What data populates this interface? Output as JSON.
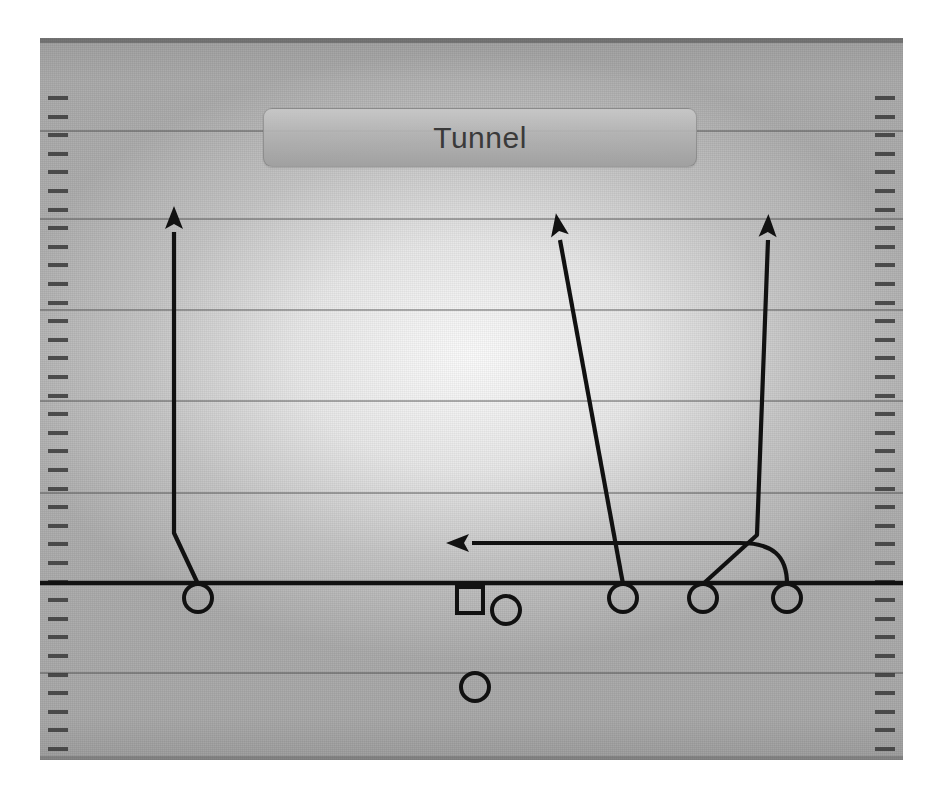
{
  "title": {
    "label": "Tunnel"
  },
  "field": {
    "background_color": "#a8a8a8",
    "line_color": "#464646",
    "scrimmage_color": "#111111",
    "bounds": {
      "left": 40,
      "top": 38,
      "width": 863,
      "height": 722
    },
    "yard_lines_y": [
      130,
      218,
      309,
      400,
      492,
      672
    ],
    "scrimmage_y": 583,
    "hash_start_y": 58,
    "hash_spacing": 18.6,
    "hash_count": 38
  },
  "diagram": {
    "type": "football-play",
    "name": "Tunnel",
    "marker_color": "#111111",
    "players": [
      {
        "id": "x-receiver",
        "shape": "circle",
        "x": 198,
        "y": 598,
        "r": 14
      },
      {
        "id": "center",
        "shape": "square",
        "x": 470,
        "y": 600,
        "size": 26
      },
      {
        "id": "quarterback",
        "shape": "circle",
        "x": 506,
        "y": 610,
        "r": 14
      },
      {
        "id": "slot-receiver",
        "shape": "circle",
        "x": 623,
        "y": 598,
        "r": 14
      },
      {
        "id": "inside-receiver",
        "shape": "circle",
        "x": 703,
        "y": 598,
        "r": 14
      },
      {
        "id": "z-receiver",
        "shape": "circle",
        "x": 787,
        "y": 598,
        "r": 14
      },
      {
        "id": "running-back",
        "shape": "circle",
        "x": 475,
        "y": 687,
        "r": 14
      }
    ],
    "routes": [
      {
        "id": "route-x-vertical",
        "from": "x-receiver",
        "path": "M 198 584 L 174 533 L 174 232",
        "arrow": {
          "x": 174,
          "y": 218,
          "angle": 0
        }
      },
      {
        "id": "route-slot-seam",
        "from": "slot-receiver",
        "path": "M 623 584 L 560 240",
        "arrow": {
          "x": 558,
          "y": 225,
          "angle": -10
        }
      },
      {
        "id": "route-inside-vertical",
        "from": "inside-receiver",
        "path": "M 703 584 L 757 535 L 768 240",
        "arrow": {
          "x": 768,
          "y": 226,
          "angle": 2
        }
      },
      {
        "id": "route-z-tunnel-drag",
        "from": "z-receiver",
        "path": "M 787 584 C 787 556, 773 543, 740 543 L 472 543",
        "arrow": {
          "x": 458,
          "y": 543,
          "angle": -90
        }
      }
    ]
  }
}
